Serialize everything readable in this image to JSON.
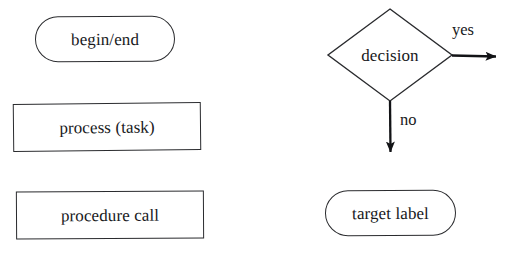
{
  "diagram": {
    "background_color": "#ffffff",
    "stroke_color": "#2a2b2e",
    "text_color": "#17181b",
    "nodes": [
      {
        "id": "begin-end",
        "shape": "stadium",
        "label": "begin/end",
        "x": 35,
        "y": 16,
        "width": 140,
        "height": 46
      },
      {
        "id": "process-task",
        "shape": "rectangle",
        "label": "process (task)",
        "x": 13,
        "y": 103,
        "width": 188,
        "height": 48
      },
      {
        "id": "procedure-call",
        "shape": "rectangle",
        "label": "procedure call",
        "x": 16,
        "y": 191,
        "width": 188,
        "height": 48
      },
      {
        "id": "decision",
        "shape": "diamond",
        "label": "decision",
        "x": 327,
        "y": 8,
        "width": 126,
        "height": 94
      },
      {
        "id": "target-label",
        "shape": "stadium",
        "label": "target label",
        "x": 325,
        "y": 190,
        "width": 131,
        "height": 46
      }
    ],
    "edges": [
      {
        "id": "yes-branch",
        "label": "yes",
        "from": "decision",
        "direction": "right",
        "label_x": 452,
        "label_y": 22
      },
      {
        "id": "no-branch",
        "label": "no",
        "from": "decision",
        "direction": "down",
        "label_x": 400,
        "label_y": 112
      }
    ]
  }
}
